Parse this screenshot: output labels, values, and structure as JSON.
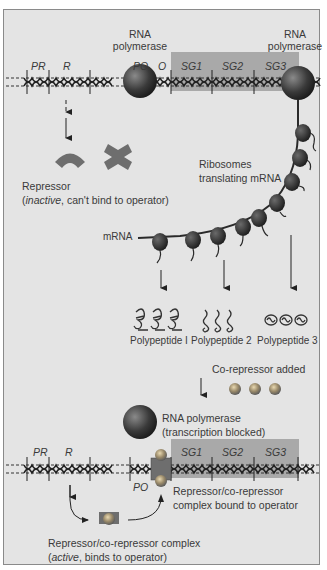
{
  "top_panel": {
    "rna_polymerase_left": "RNA\npolymerase",
    "rna_polymerase_right": "RNA\npolymerase",
    "gene_labels": {
      "pr": "PR",
      "r": "R",
      "po": "PO",
      "o": "O",
      "sg1": "SG1",
      "sg2": "SG2",
      "sg3": "SG3"
    },
    "repressor_line1": "Repressor",
    "repressor_line2_open": "(",
    "repressor_line2_italic": "inactive",
    "repressor_line2_rest": ", can't bind to operator)",
    "ribosomes_line1": "Ribosomes",
    "ribosomes_line2": "translating mRNA",
    "mrna_label": "mRNA",
    "polypeptides": [
      "Polypeptide I",
      "Polypeptide 2",
      "Polypeptide 3"
    ]
  },
  "middle": {
    "corepressor_added": "Co-repressor added"
  },
  "bottom_panel": {
    "rna_pol_line1": "RNA polymerase",
    "rna_pol_line2": "(transcription blocked)",
    "gene_labels": {
      "pr": "PR",
      "r": "R",
      "po": "PO",
      "sg1": "SG1",
      "sg2": "SG2",
      "sg3": "SG3"
    },
    "bound_line1": "Repressor/co-repressor",
    "bound_line2": "complex bound to operator",
    "complex_line1": "Repressor/co-repressor complex",
    "complex_line2_open": "(",
    "complex_line2_italic": "active",
    "complex_line2_rest": ", binds to operator)"
  },
  "colors": {
    "background": "#e4e4e4",
    "gene_box": "#a9a9a9",
    "repressor": "#6e6e6e",
    "polymerase": "#3c3c3c",
    "corepressor": "#9a9a9a",
    "text": "#3a3a3a"
  }
}
